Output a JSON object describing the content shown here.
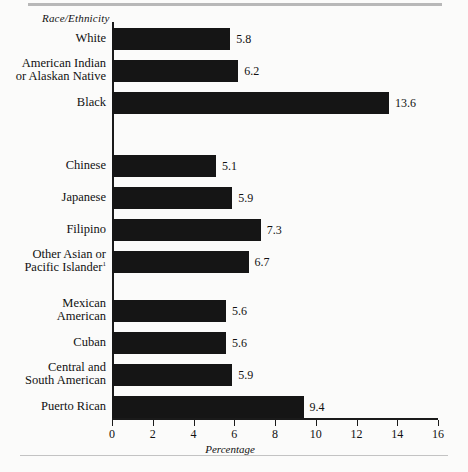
{
  "chart_data": {
    "type": "bar",
    "orientation": "horizontal",
    "title": "",
    "xlabel": "Percentage",
    "ylabel": "Race/Ethnicity",
    "xlim": [
      0,
      16
    ],
    "xticks": [
      0,
      2,
      4,
      6,
      8,
      10,
      12,
      14,
      16
    ],
    "grid": false,
    "legend": null,
    "footnote_marker": "1",
    "categories": [
      "White",
      "American Indian\nor Alaskan Native",
      "Black",
      "Chinese",
      "Japanese",
      "Filipino",
      "Other Asian or\nPacific Islander",
      "Mexican\nAmerican",
      "Cuban",
      "Central and\nSouth American",
      "Puerto Rican"
    ],
    "values": [
      5.8,
      6.2,
      13.6,
      5.1,
      5.9,
      7.3,
      6.7,
      5.6,
      5.6,
      5.9,
      9.4
    ],
    "value_labels": [
      "5.8",
      "6.2",
      "13.6",
      "5.1",
      "5.9",
      "7.3",
      "6.7",
      "5.6",
      "5.6",
      "5.9",
      "9.4"
    ],
    "groups": [
      {
        "name": "group-1",
        "indices": [
          0,
          1,
          2
        ]
      },
      {
        "name": "group-2",
        "indices": [
          3,
          4,
          5,
          6
        ]
      },
      {
        "name": "group-3",
        "indices": [
          7,
          8,
          9,
          10
        ]
      }
    ],
    "bar_color": "#151515",
    "axis_color": "#1a1a1a",
    "background_color": "#fbfbfa"
  },
  "axis": {
    "y_title": "Race/Ethnicity",
    "x_title": "Percentage",
    "tick_labels": [
      "0",
      "2",
      "4",
      "6",
      "8",
      "10",
      "12",
      "14",
      "16"
    ]
  },
  "bars": [
    {
      "label": "White",
      "label_html": "White",
      "value": "5.8",
      "top": 28
    },
    {
      "label": "American Indian or Alaskan Native",
      "label_html": "American Indian\nor Alaskan Native",
      "value": "6.2",
      "top": 60
    },
    {
      "label": "Black",
      "label_html": "Black",
      "value": "13.6",
      "top": 92
    },
    {
      "label": "Chinese",
      "label_html": "Chinese",
      "value": "5.1",
      "top": 155
    },
    {
      "label": "Japanese",
      "label_html": "Japanese",
      "value": "5.9",
      "top": 187
    },
    {
      "label": "Filipino",
      "label_html": "Filipino",
      "value": "7.3",
      "top": 219
    },
    {
      "label": "Other Asian or Pacific Islander",
      "label_html": "Other Asian or\nPacific Islander",
      "value": "6.7",
      "top": 251,
      "footnote": "1"
    },
    {
      "label": "Mexican American",
      "label_html": "Mexican\nAmerican",
      "value": "5.6",
      "top": 300
    },
    {
      "label": "Cuban",
      "label_html": "Cuban",
      "value": "5.6",
      "top": 332
    },
    {
      "label": "Central and South American",
      "label_html": "Central and\nSouth American",
      "value": "5.9",
      "top": 364
    },
    {
      "label": "Puerto Rican",
      "label_html": "Puerto Rican",
      "value": "9.4",
      "top": 396
    }
  ]
}
